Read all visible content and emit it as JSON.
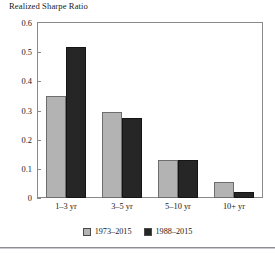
{
  "chart_data": {
    "type": "bar",
    "title": "Realized Sharpe Ratio",
    "xlabel": "",
    "ylabel": "",
    "categories": [
      "1–3 yr",
      "3–5 yr",
      "5–10 yr",
      "10+ yr"
    ],
    "series": [
      {
        "name": "1973–2015",
        "color": "#b3b3b3",
        "values": [
          0.35,
          0.295,
          0.13,
          0.055
        ]
      },
      {
        "name": "1988–2015",
        "color": "#262626",
        "values": [
          0.517,
          0.275,
          0.13,
          0.02
        ]
      }
    ],
    "ylim": [
      0,
      0.6
    ],
    "yticks": [
      0,
      0.1,
      0.2,
      0.3,
      0.4,
      0.5,
      0.6
    ],
    "ytick_labels": [
      "0",
      "0.1",
      "0.2",
      "0.3",
      "0.4",
      "0.5",
      "0.6"
    ],
    "grid": false,
    "legend_position": "bottom-center"
  },
  "legend": {
    "items": [
      {
        "label": "1973–2015",
        "swatch": "legend-swatch-series-a"
      },
      {
        "label": "1988–2015",
        "swatch": "legend-swatch-series-b"
      }
    ]
  }
}
